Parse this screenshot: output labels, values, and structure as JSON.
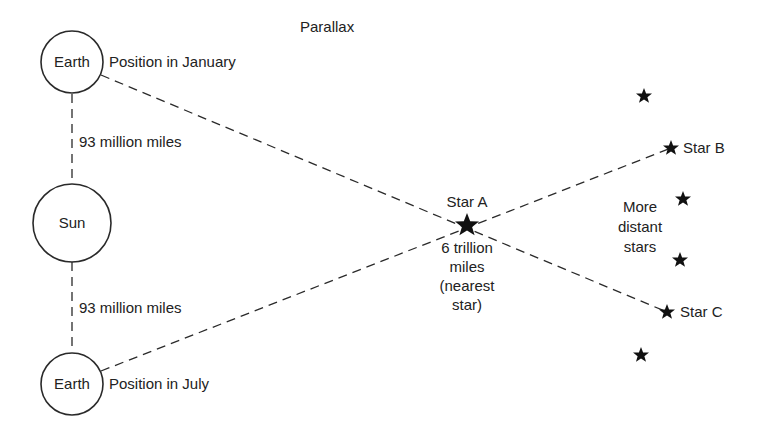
{
  "title": "Parallax",
  "bodies": {
    "earth_january": {
      "label": "Earth",
      "caption": "Position in January"
    },
    "sun": {
      "label": "Sun"
    },
    "earth_july": {
      "label": "Earth",
      "caption": "Position in July"
    }
  },
  "distances": {
    "earth_sun_top": "93 million miles",
    "earth_sun_bottom": "93 million miles"
  },
  "star_a": {
    "label": "Star A",
    "distance_lines": [
      "6 trillion",
      "miles",
      "(nearest",
      "star)"
    ]
  },
  "star_b": {
    "label": "Star B"
  },
  "star_c": {
    "label": "Star C"
  },
  "distant_stars": {
    "label_lines": [
      "More",
      "distant",
      "stars"
    ]
  },
  "colors": {
    "ink": "#222222",
    "background": "#ffffff"
  }
}
